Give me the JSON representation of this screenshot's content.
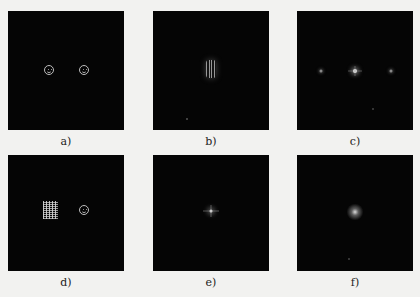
{
  "figure": {
    "background": "#f2f2f0",
    "panel_color": "#050505",
    "panels": [
      {
        "id": "a",
        "label": "a)",
        "content": "two smiley faces (spatial domain)"
      },
      {
        "id": "b",
        "label": "b)",
        "content": "vertical striped bright spot near center"
      },
      {
        "id": "c",
        "label": "c)",
        "content": "three point spots along horizontal line with center peak"
      },
      {
        "id": "d",
        "label": "d)",
        "content": "noise patch and one smiley face"
      },
      {
        "id": "e",
        "label": "e)",
        "content": "small centered cross-shaped peak"
      },
      {
        "id": "f",
        "label": "f)",
        "content": "diffuse centered glow"
      }
    ]
  }
}
